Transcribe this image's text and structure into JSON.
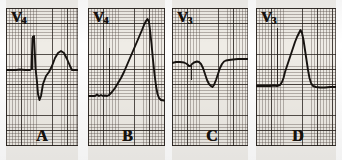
{
  "figure": {
    "kind": "ecg-strip-figure",
    "background_color": "#efece6",
    "trace_color": "#16120f",
    "grid_fine_color": "#5a504b",
    "grid_bold_color": "#28221e",
    "grid_fine_mm_px": 3.05,
    "grid_bold_mm_px": 15.25
  },
  "panels": [
    {
      "letter": "A",
      "lead": "V",
      "lead_subscript": "4",
      "lead_label": "V4",
      "morphology": "rS complex with small r wave, deep S wave and upright T wave",
      "x": 6,
      "width": 72,
      "letter_left": 30
    },
    {
      "letter": "B",
      "lead": "V",
      "lead_subscript": "4",
      "lead_label": "V4",
      "morphology": "tall peaked R wave with slow upstroke and rapid downstroke",
      "x": 88,
      "width": 77,
      "letter_left": 34
    },
    {
      "letter": "C",
      "lead": "V",
      "lead_subscript": "3",
      "lead_label": "V3",
      "morphology": "two negative QS deflections, second deeper",
      "x": 172,
      "width": 76,
      "letter_left": 34
    },
    {
      "letter": "D",
      "lead": "V",
      "lead_subscript": "3",
      "lead_label": "V3",
      "morphology": "tall peaked R wave rising from baseline",
      "x": 256,
      "width": 80,
      "letter_left": 36
    }
  ],
  "traces": {
    "A": "M0,62 L10,62 L14,61.5 L19,62 L24,62 L25.5,61 L26.5,30 L28,28 L29.5,60 L31,74 L32,86 L33.5,92 L35,88 L37,76 L40,68 L43,64 L46,58 L49,50 L52,45 L55,43 L58,45 L61,51 L64,58 L66,62 L70,62 L76,62 L82,62",
    "B": "M0,88 L7,88 L9,86.5 L11,88 L13,87 L15,88 L17,87.5 L19,88 L21,87 L24,84 L27,80 L30,75 L33,70 L36,64 L39,57 L42,50 L45,43 L48,36 L51,29 L54,22 L56,17 L58,13 L59.5,11 L61,14 L62,22 L63.5,36 L65,52 L66.5,66 L68,78 L69.5,86 L71,90 L73,92 L76,92.5 L80,92 L84,91 L88,90.5 L92,90",
    "C": "M0,55 L4,54 L8,54 L12,54.5 L15,56 L17,58 L18.5,58 L20,56 L22,54.5 L25,53.5 L27,54 L29,56 L31,60 L33,66 L35,72 L37,76 L39,78 L40.5,79 L42,77 L44,72 L46,66 L48,60 L50,56 L52,53.5 L54,52.5 L57,52 L61,51.5 L66,51 L72,51 L78,51",
    "D": "M0,78 L8,78 L14,78 L18,77.5 L21,78 L24,77 L26,74 L27.5,70 L29,64 L31,58 L33,52 L35,46 L37,40 L39,34 L41,29 L43,25 L44.5,22 L46,25 L47.5,32 L49,42 L50.5,52 L52,62 L53.5,70 L55,75 L57,78 L60,79 L64,79.5 L69,79.5 L74,79 L80,79"
  },
  "calibration_marks": [
    {
      "panel": "A",
      "left": 26,
      "top": 28,
      "height": 34
    },
    {
      "panel": "B",
      "left": 21,
      "top": 40,
      "height": 48
    },
    {
      "panel": "C",
      "left": 19,
      "top": 58,
      "height": 14
    },
    {
      "panel": "D",
      "left": 21,
      "top": 20,
      "height": 58
    }
  ]
}
